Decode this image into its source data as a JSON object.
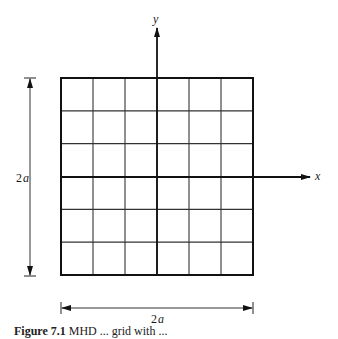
{
  "figure": {
    "axes": {
      "x_label": "x",
      "y_label": "y"
    },
    "grid": {
      "rows": 6,
      "cols": 6,
      "left": 61,
      "top": 78,
      "right": 253,
      "bottom": 275
    },
    "dimensions": {
      "vertical_label": "2",
      "vertical_label_var": "a",
      "horizontal_label": "2",
      "horizontal_label_var": "a"
    },
    "caption": {
      "number": "Figure 7.1",
      "text": " MHD ... grid with ..."
    }
  }
}
